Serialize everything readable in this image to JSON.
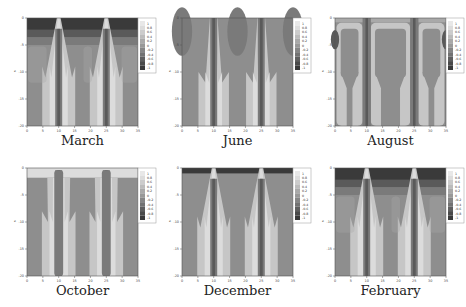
{
  "figure": {
    "panels": [
      {
        "id": "march",
        "caption": "March",
        "pattern": "winter",
        "x": 0,
        "y": 0
      },
      {
        "id": "june",
        "caption": "June",
        "pattern": "summer",
        "x": 155,
        "y": 0
      },
      {
        "id": "august",
        "caption": "August",
        "pattern": "august",
        "x": 308,
        "y": 0
      },
      {
        "id": "october",
        "caption": "October",
        "pattern": "october",
        "x": 0,
        "y": 150
      },
      {
        "id": "december",
        "caption": "December",
        "pattern": "december",
        "x": 155,
        "y": 150
      },
      {
        "id": "february",
        "caption": "February",
        "pattern": "winter",
        "x": 308,
        "y": 150
      }
    ],
    "colors": {
      "darkest": "#3a3a3a",
      "dark": "#5a5a5a",
      "mid_dark": "#7a7a7a",
      "background": "#8e8e8e",
      "mid_light": "#a9a9a9",
      "light": "#c6c6c6",
      "lightest": "#dcdcdc"
    }
  },
  "chart_data": [
    {
      "type": "heatmap",
      "title": "March",
      "xlabel": "x",
      "ylabel": "z",
      "xticks": [
        0,
        5,
        10,
        15,
        20,
        25,
        30,
        35
      ],
      "yticks": [
        0,
        -5,
        -10,
        -15,
        -20
      ],
      "xlim": [
        0,
        35
      ],
      "ylim": [
        -20,
        0
      ],
      "colorbar_levels": [
        1,
        0.8,
        0.6,
        0.4,
        0.2,
        0,
        -0.2,
        -0.4,
        -0.6,
        -0.8,
        -1
      ]
    },
    {
      "type": "heatmap",
      "title": "June",
      "xlabel": "x",
      "ylabel": "z",
      "xticks": [
        0,
        5,
        10,
        15,
        20,
        25,
        30,
        35
      ],
      "yticks": [
        0,
        -5,
        -10,
        -15,
        -20
      ],
      "xlim": [
        0,
        35
      ],
      "ylim": [
        -20,
        0
      ],
      "colorbar_levels": [
        1,
        0.8,
        0.6,
        0.4,
        0.2,
        0,
        -0.2,
        -0.4,
        -0.6,
        -0.8,
        -1
      ]
    },
    {
      "type": "heatmap",
      "title": "August",
      "xlabel": "x",
      "ylabel": "z",
      "xticks": [
        0,
        5,
        10,
        15,
        20,
        25,
        30,
        35
      ],
      "yticks": [
        0,
        -5,
        -10,
        -15,
        -20
      ],
      "xlim": [
        0,
        35
      ],
      "ylim": [
        -20,
        0
      ],
      "colorbar_levels": [
        1,
        0.8,
        0.6,
        0.4,
        0.2,
        0,
        -0.2,
        -0.4,
        -0.6,
        -0.8,
        -1
      ]
    },
    {
      "type": "heatmap",
      "title": "October",
      "xlabel": "x",
      "ylabel": "z",
      "xticks": [
        0,
        5,
        10,
        15,
        20,
        25,
        30,
        35
      ],
      "yticks": [
        0,
        -5,
        -10,
        -15,
        -20
      ],
      "xlim": [
        0,
        35
      ],
      "ylim": [
        -20,
        0
      ],
      "colorbar_levels": [
        1,
        0.8,
        0.6,
        0.4,
        0.2,
        0,
        -0.2,
        -0.4,
        -0.6,
        -0.8,
        -1
      ]
    },
    {
      "type": "heatmap",
      "title": "December",
      "xlabel": "x",
      "ylabel": "z",
      "xticks": [
        0,
        5,
        10,
        15,
        20,
        25,
        30,
        35
      ],
      "yticks": [
        0,
        -5,
        -10,
        -15,
        -20
      ],
      "xlim": [
        0,
        35
      ],
      "ylim": [
        -20,
        0
      ],
      "colorbar_levels": [
        1,
        0.8,
        0.6,
        0.4,
        0.2,
        0,
        -0.2,
        -0.4,
        -0.6,
        -0.8,
        -1
      ]
    },
    {
      "type": "heatmap",
      "title": "February",
      "xlabel": "x",
      "ylabel": "z",
      "xticks": [
        0,
        5,
        10,
        15,
        20,
        25,
        30,
        35
      ],
      "yticks": [
        0,
        -5,
        -10,
        -15,
        -20
      ],
      "xlim": [
        0,
        35
      ],
      "ylim": [
        -20,
        0
      ],
      "colorbar_levels": [
        1,
        0.8,
        0.6,
        0.4,
        0.2,
        0,
        -0.2,
        -0.4,
        -0.6,
        -0.8,
        -1
      ]
    }
  ]
}
